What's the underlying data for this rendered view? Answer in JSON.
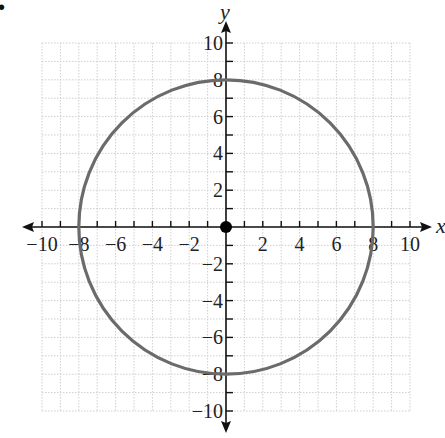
{
  "chart_data": {
    "type": "line",
    "title": "",
    "xlabel": "x",
    "ylabel": "y",
    "xlim": [
      -10,
      10
    ],
    "ylim": [
      -10,
      10
    ],
    "grid": true,
    "x_tick_labels": [
      "−10",
      "−8",
      "−6",
      "−4",
      "−2",
      "2",
      "4",
      "6",
      "8",
      "10"
    ],
    "x_tick_values": [
      -10,
      -8,
      -6,
      -4,
      -2,
      2,
      4,
      6,
      8,
      10
    ],
    "y_tick_labels": [
      "10",
      "8",
      "6",
      "4",
      "2",
      "−2",
      "−4",
      "−6",
      "−8",
      "−10"
    ],
    "y_tick_values": [
      10,
      8,
      6,
      4,
      2,
      -2,
      -4,
      -6,
      -8,
      -10
    ],
    "series": [
      {
        "name": "circle",
        "shape": "circle",
        "center": [
          0,
          0
        ],
        "radius": 8,
        "color": "#6b6b6b"
      }
    ],
    "points": [
      {
        "name": "center",
        "x": 0,
        "y": 0,
        "color": "#000000"
      }
    ]
  },
  "corner_mark": "•"
}
